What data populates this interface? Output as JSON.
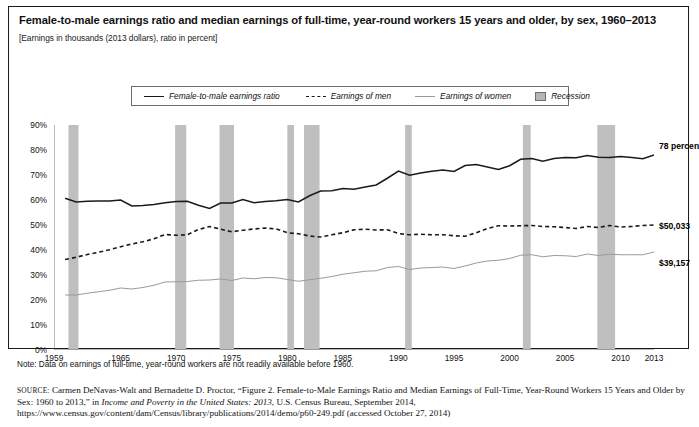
{
  "figure": {
    "title": "Female-to-male earnings ratio and median earnings of full-time, year-round workers 15 years and older, by sex, 1960–2013",
    "subtitle": "[Earnings in thousands (2013 dollars), ratio in percent]",
    "note": "Note: Data on earnings of full-time, year-round workers are not readily available before 1960.",
    "source_label": "SOURCE:",
    "source_part1": " Carmen DeNavas-Walt and Bernadette D. Proctor, “Figure 2. Female-to-Male Earnings Ratio and Median Earnings of Full-Time, Year-Round Workers 15 Years and Older by Sex: 1960 to 2013,” in ",
    "source_italic": "Income and Poverty in the United States: 2013",
    "source_part2": ", U.S. Census Bureau, September 2014, https://www.census.gov/content/dam/Census/library/publications/2014/demo/p60-249.pdf (accessed October 27, 2014)"
  },
  "legend": {
    "items": [
      {
        "label": "Female-to-male earnings ratio",
        "style": "solid",
        "icon": "solid-line-swatch"
      },
      {
        "label": "Earnings of men",
        "style": "dashed",
        "icon": "dashed-line-swatch"
      },
      {
        "label": "Earnings of women",
        "style": "thin",
        "icon": "thin-line-swatch"
      },
      {
        "label": "Recession",
        "style": "box",
        "icon": "recession-box-swatch"
      }
    ]
  },
  "annotations": [
    {
      "name": "ratio-end-label",
      "text": "78 percent",
      "x": 650,
      "y": 134
    },
    {
      "name": "men-earnings-end-label",
      "text": "$50,033",
      "x": 650,
      "y": 214
    },
    {
      "name": "women-earnings-end-label",
      "text": "$39,157",
      "x": 650,
      "y": 251
    }
  ],
  "colors": {
    "ratio_line": "#1a1a1a",
    "men_line": "#1a1a1a",
    "women_line": "#9a9a9a",
    "recession_band": "#bfbfbf",
    "axis": "#777777",
    "border": "#1b1b1b"
  },
  "chart_data": {
    "type": "line",
    "title": "Female-to-male earnings ratio and median earnings of full-time, year-round workers 15 years and older, by sex, 1960–2013",
    "subtitle": "[Earnings in thousands (2013 dollars), ratio in percent]",
    "xlabel": "",
    "ylabel": "",
    "grid": false,
    "legend_position": "top",
    "xlim": [
      1959,
      2013
    ],
    "ylim": [
      0,
      90
    ],
    "ytick_labels": [
      "0%",
      "10%",
      "20%",
      "30%",
      "40%",
      "50%",
      "60%",
      "70%",
      "80%",
      "90%"
    ],
    "ytick_values": [
      0,
      10,
      20,
      30,
      40,
      50,
      60,
      70,
      80,
      90
    ],
    "xtick_labels": [
      "1959",
      "1965",
      "1970",
      "1975",
      "1980",
      "1985",
      "1990",
      "1995",
      "2000",
      "2005",
      "2010",
      "2013"
    ],
    "xtick_values": [
      1959,
      1965,
      1970,
      1975,
      1980,
      1985,
      1990,
      1995,
      2000,
      2005,
      2010,
      2013
    ],
    "x": [
      1960,
      1961,
      1962,
      1963,
      1964,
      1965,
      1966,
      1967,
      1968,
      1969,
      1970,
      1971,
      1972,
      1973,
      1974,
      1975,
      1976,
      1977,
      1978,
      1979,
      1980,
      1981,
      1982,
      1983,
      1984,
      1985,
      1986,
      1987,
      1988,
      1989,
      1990,
      1991,
      1992,
      1993,
      1994,
      1995,
      1996,
      1997,
      1998,
      1999,
      2000,
      2001,
      2002,
      2003,
      2004,
      2005,
      2006,
      2007,
      2008,
      2009,
      2010,
      2011,
      2012,
      2013
    ],
    "series": [
      {
        "name": "Female-to-male earnings ratio",
        "style": "solid",
        "unit": "percent",
        "values": [
          60.7,
          59.2,
          59.5,
          59.6,
          59.6,
          60.0,
          57.6,
          57.8,
          58.2,
          58.9,
          59.4,
          59.5,
          57.9,
          56.6,
          58.8,
          58.8,
          60.2,
          58.9,
          59.4,
          59.7,
          60.2,
          59.2,
          61.7,
          63.6,
          63.7,
          64.6,
          64.3,
          65.2,
          66.0,
          68.7,
          71.6,
          69.9,
          70.8,
          71.5,
          72.0,
          71.4,
          73.8,
          74.2,
          73.2,
          72.2,
          73.7,
          76.3,
          76.6,
          75.5,
          76.6,
          77.0,
          76.9,
          77.8,
          77.1,
          77.0,
          77.4,
          77.0,
          76.5,
          78.0
        ]
      },
      {
        "name": "Earnings of men",
        "style": "dashed",
        "unit": "thousands of 2013 dollars",
        "values": [
          36.2,
          37.1,
          38.2,
          39.1,
          40.1,
          41.3,
          42.4,
          43.3,
          44.5,
          46.2,
          45.9,
          46.1,
          48.2,
          49.4,
          48.3,
          47.3,
          47.9,
          48.4,
          48.8,
          48.4,
          46.9,
          46.5,
          45.6,
          45.2,
          46.1,
          46.9,
          48.1,
          48.3,
          48.0,
          48.1,
          46.6,
          46.1,
          46.3,
          46.1,
          46.1,
          45.7,
          45.5,
          46.9,
          48.6,
          49.7,
          49.6,
          49.7,
          49.8,
          49.4,
          49.3,
          49.0,
          48.6,
          49.4,
          49.0,
          49.8,
          49.2,
          49.4,
          49.8,
          50.0
        ],
        "end_label": "$50,033"
      },
      {
        "name": "Earnings of women",
        "style": "thin",
        "unit": "thousands of 2013 dollars",
        "values": [
          22.0,
          22.0,
          22.7,
          23.3,
          23.9,
          24.8,
          24.4,
          25.0,
          25.9,
          27.2,
          27.3,
          27.4,
          27.9,
          28.0,
          28.4,
          27.8,
          28.8,
          28.5,
          29.0,
          28.9,
          28.2,
          27.5,
          28.1,
          28.7,
          29.4,
          30.3,
          30.9,
          31.5,
          31.7,
          33.0,
          33.4,
          32.2,
          32.8,
          33.0,
          33.2,
          32.6,
          33.6,
          34.8,
          35.6,
          35.9,
          36.6,
          37.9,
          38.1,
          37.3,
          37.8,
          37.7,
          37.4,
          38.4,
          37.8,
          38.3,
          38.1,
          38.1,
          38.1,
          39.2
        ],
        "end_label": "$39,157"
      }
    ],
    "recession_bands": [
      {
        "start": 1960.3,
        "end": 1961.2
      },
      {
        "start": 1969.9,
        "end": 1970.9
      },
      {
        "start": 1973.9,
        "end": 1975.2
      },
      {
        "start": 1980.0,
        "end": 1980.6
      },
      {
        "start": 1981.5,
        "end": 1982.9
      },
      {
        "start": 1990.6,
        "end": 1991.2
      },
      {
        "start": 2001.2,
        "end": 2001.9
      },
      {
        "start": 2007.9,
        "end": 2009.5
      }
    ]
  }
}
